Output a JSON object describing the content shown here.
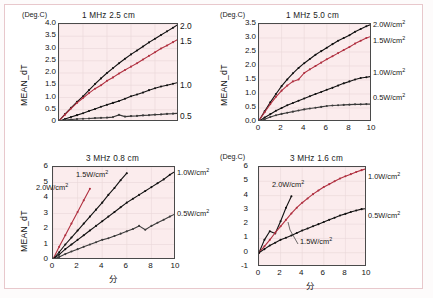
{
  "figure": {
    "y_axis_label": "MEAN_dT",
    "y_unit": "(Deg.C)",
    "x_axis_label": "分"
  },
  "chart_data": [
    {
      "type": "line",
      "id": "top-left",
      "title": "1 MHz 2.5 cm",
      "ylabel": "MEAN_dT",
      "yunit": "(Deg.C)",
      "xlabel": "分",
      "xlim": [
        0,
        10
      ],
      "ylim": [
        0,
        4.0
      ],
      "xticks": [
        "0",
        "2",
        "4",
        "6",
        "8",
        "10"
      ],
      "xticks_visible": false,
      "yticks": [
        "0",
        "0.5",
        "1.0",
        "1.5",
        "2.0",
        "2.5",
        "3.0",
        "3.5",
        "4.0"
      ],
      "right_labels": [
        "2.0",
        "1.5",
        "1.0",
        "0.5"
      ],
      "right_labels_unit": "W/cm2",
      "grid": true,
      "legend_position": "right",
      "series": [
        {
          "name": "2.0W/cm2",
          "color": "#111111",
          "x": [
            0,
            0.5,
            1,
            1.5,
            2,
            2.5,
            3,
            3.5,
            4,
            4.5,
            5,
            5.5,
            6,
            6.5,
            7,
            7.5,
            8,
            8.5,
            9,
            9.5,
            10
          ],
          "values": [
            0.05,
            0.32,
            0.58,
            0.82,
            1.05,
            1.3,
            1.55,
            1.78,
            2.0,
            2.2,
            2.4,
            2.58,
            2.76,
            2.92,
            3.08,
            3.25,
            3.4,
            3.55,
            3.7,
            3.85,
            4.0
          ]
        },
        {
          "name": "1.5W/cm2",
          "color": "#b03040",
          "x": [
            0,
            0.5,
            1,
            1.5,
            2,
            2.5,
            3,
            3.5,
            4,
            4.5,
            5,
            5.5,
            6,
            6.5,
            7,
            7.5,
            8,
            8.5,
            9,
            9.5,
            10
          ],
          "values": [
            0.05,
            0.3,
            0.55,
            0.78,
            0.98,
            1.18,
            1.36,
            1.5,
            1.68,
            1.82,
            1.98,
            2.12,
            2.26,
            2.4,
            2.55,
            2.7,
            2.85,
            3.0,
            3.12,
            3.26,
            3.4
          ]
        },
        {
          "name": "1.0W/cm2",
          "color": "#111111",
          "x": [
            0,
            0.5,
            1,
            1.5,
            2,
            2.5,
            3,
            3.5,
            4,
            4.5,
            5,
            5.5,
            6,
            6.5,
            7,
            7.5,
            8,
            8.5,
            9,
            9.5,
            10
          ],
          "values": [
            0.03,
            0.12,
            0.2,
            0.28,
            0.36,
            0.45,
            0.53,
            0.62,
            0.7,
            0.78,
            0.86,
            0.95,
            1.05,
            1.12,
            1.2,
            1.3,
            1.38,
            1.45,
            1.5,
            1.56,
            1.62
          ]
        },
        {
          "name": "0.5W/cm2",
          "color": "#3a3a3a",
          "x": [
            0,
            0.5,
            1,
            1.5,
            2,
            2.5,
            3,
            3.5,
            4,
            4.5,
            5,
            5.5,
            6,
            6.5,
            7,
            7.5,
            8,
            8.5,
            9,
            9.5,
            10
          ],
          "values": [
            0.02,
            0.08,
            0.1,
            0.12,
            0.13,
            0.14,
            0.16,
            0.17,
            0.18,
            0.2,
            0.29,
            0.22,
            0.24,
            0.25,
            0.27,
            0.28,
            0.3,
            0.31,
            0.33,
            0.34,
            0.36
          ]
        }
      ]
    },
    {
      "type": "line",
      "id": "top-right",
      "title": "1 MHz 5.0 cm",
      "ylabel": "MEAN_dT",
      "yunit": "(Deg.C)",
      "xlabel": "分",
      "xlim": [
        0,
        10
      ],
      "ylim": [
        0,
        3.5
      ],
      "xticks": [
        "0",
        "2",
        "4",
        "6",
        "8",
        "10"
      ],
      "xticks_visible": true,
      "yticks": [
        "0.0",
        "0.5",
        "1.0",
        "1.5",
        "2.0",
        "2.5",
        "3.0",
        "3.5"
      ],
      "grid": true,
      "legend_position": "right",
      "right_legend": [
        "2.0W/cm2",
        "1.5W/cm2",
        "1.0W/cm2",
        "0.5W/cm2"
      ],
      "series": [
        {
          "name": "2.0W/cm2",
          "color": "#111111",
          "x": [
            0,
            0.5,
            1,
            1.5,
            2,
            2.5,
            3,
            3.5,
            4,
            4.5,
            5,
            5.5,
            6,
            6.5,
            7,
            7.5,
            8,
            8.5,
            9,
            9.5,
            10
          ],
          "values": [
            0.05,
            0.38,
            0.7,
            1.0,
            1.28,
            1.52,
            1.74,
            1.93,
            2.1,
            2.25,
            2.4,
            2.53,
            2.65,
            2.78,
            2.9,
            3.0,
            3.1,
            3.22,
            3.32,
            3.42,
            3.5
          ]
        },
        {
          "name": "1.5W/cm2",
          "color": "#b03040",
          "x": [
            0,
            0.5,
            1,
            1.5,
            2,
            2.5,
            3,
            3.5,
            4,
            4.5,
            5,
            5.5,
            6,
            6.5,
            7,
            7.5,
            8,
            8.5,
            9,
            9.5,
            10
          ],
          "values": [
            0.05,
            0.35,
            0.64,
            0.9,
            1.12,
            1.3,
            1.45,
            1.52,
            1.75,
            1.88,
            2.0,
            2.12,
            2.24,
            2.35,
            2.46,
            2.57,
            2.68,
            2.8,
            2.9,
            3.0,
            3.07
          ]
        },
        {
          "name": "1.0W/cm2",
          "color": "#111111",
          "x": [
            0,
            0.5,
            1,
            1.5,
            2,
            2.5,
            3,
            3.5,
            4,
            4.5,
            5,
            5.5,
            6,
            6.5,
            7,
            7.5,
            8,
            8.5,
            9,
            9.5,
            10
          ],
          "values": [
            0.03,
            0.16,
            0.28,
            0.4,
            0.5,
            0.6,
            0.68,
            0.76,
            0.84,
            0.92,
            1.0,
            1.07,
            1.15,
            1.22,
            1.3,
            1.38,
            1.45,
            1.52,
            1.57,
            1.6,
            1.63
          ]
        },
        {
          "name": "0.5W/cm2",
          "color": "#3a3a3a",
          "x": [
            0,
            0.5,
            1,
            1.5,
            2,
            2.5,
            3,
            3.5,
            4,
            4.5,
            5,
            5.5,
            6,
            6.5,
            7,
            7.5,
            8,
            8.5,
            9,
            9.5,
            10
          ],
          "values": [
            0.02,
            0.1,
            0.18,
            0.24,
            0.29,
            0.33,
            0.37,
            0.41,
            0.45,
            0.48,
            0.51,
            0.54,
            0.57,
            0.59,
            0.6,
            0.61,
            0.62,
            0.63,
            0.63,
            0.64,
            0.64
          ]
        }
      ]
    },
    {
      "type": "line",
      "id": "bottom-left",
      "title": "3 MHz 0.8 cm",
      "ylabel": "MEAN_dT",
      "xlabel": "分",
      "xlim": [
        0,
        10
      ],
      "ylim": [
        0,
        6
      ],
      "xticks": [
        "0",
        "2",
        "4",
        "6",
        "8",
        "10"
      ],
      "xticks_visible": true,
      "yticks": [
        "0",
        "1",
        "2",
        "3",
        "4",
        "5",
        "6"
      ],
      "grid": true,
      "inline_labels": [
        "1.5W/cm2",
        "2.0W/cm2"
      ],
      "right_legend": [
        "1.0W/cm2",
        "0.5W/cm2"
      ],
      "series": [
        {
          "name": "2.0W/cm2",
          "color": "#b03040",
          "x": [
            0,
            0.5,
            1,
            1.5,
            2,
            2.5,
            3
          ],
          "values": [
            0.05,
            0.85,
            1.6,
            2.35,
            3.1,
            3.85,
            4.6
          ]
        },
        {
          "name": "1.5W/cm2",
          "color": "#111111",
          "x": [
            0,
            0.5,
            1,
            1.5,
            2,
            2.5,
            3,
            3.5,
            4,
            4.5,
            5,
            5.5,
            6
          ],
          "values": [
            0.05,
            0.5,
            1.0,
            1.45,
            1.9,
            2.35,
            2.8,
            3.25,
            3.7,
            4.2,
            4.65,
            5.15,
            5.6
          ]
        },
        {
          "name": "1.0W/cm2",
          "color": "#111111",
          "x": [
            0,
            0.5,
            1,
            1.5,
            2,
            2.5,
            3,
            3.5,
            4,
            4.5,
            5,
            5.5,
            6,
            6.5,
            7,
            7.5,
            8,
            8.5,
            9,
            9.5,
            10
          ],
          "values": [
            0.05,
            0.35,
            0.7,
            1.0,
            1.3,
            1.6,
            1.9,
            2.2,
            2.5,
            2.8,
            3.1,
            3.4,
            3.7,
            3.95,
            4.2,
            4.45,
            4.7,
            4.95,
            5.2,
            5.5,
            5.75
          ]
        },
        {
          "name": "0.5W/cm2",
          "color": "#3a3a3a",
          "x": [
            0,
            0.5,
            1,
            1.5,
            2,
            2.5,
            3,
            3.5,
            4,
            4.5,
            5,
            5.5,
            6,
            6.5,
            7,
            7.5,
            8,
            8.5,
            9,
            9.5,
            10
          ],
          "values": [
            0.03,
            0.2,
            0.38,
            0.55,
            0.7,
            0.85,
            1.0,
            1.15,
            1.3,
            1.4,
            1.55,
            1.7,
            1.85,
            2.0,
            2.2,
            1.95,
            2.2,
            2.4,
            2.6,
            2.8,
            3.0
          ]
        }
      ]
    },
    {
      "type": "line",
      "id": "bottom-right",
      "title": "3 MHz 1.6 cm",
      "ylabel": "MEAN_dT",
      "yunit": "(Deg.C)",
      "xlabel": "分",
      "xlim": [
        0,
        10
      ],
      "ylim": [
        -1,
        6
      ],
      "xticks": [
        "0",
        "2",
        "4",
        "6",
        "8",
        "10"
      ],
      "xticks_visible": true,
      "yticks": [
        "-1",
        "0",
        "1",
        "2",
        "3",
        "4",
        "5",
        "6"
      ],
      "grid": true,
      "inline_labels": [
        "2.0W/cm2",
        "1.5W/cm2"
      ],
      "right_legend": [
        "1.0W/cm2",
        "0.5W/cm2"
      ],
      "series": [
        {
          "name": "2.0W/cm2",
          "color": "#111111",
          "x": [
            0,
            0.5,
            1,
            1.5,
            2,
            2.5,
            3
          ],
          "values": [
            0.0,
            0.9,
            1.5,
            1.35,
            2.2,
            3.15,
            3.95
          ]
        },
        {
          "name": "1.0W/cm2",
          "color": "#b03040",
          "x": [
            0,
            0.5,
            1,
            1.5,
            2,
            2.5,
            3,
            3.5,
            4,
            4.5,
            5,
            5.5,
            6,
            6.5,
            7,
            7.5,
            8,
            8.5,
            9,
            9.5,
            10
          ],
          "values": [
            0.0,
            0.45,
            0.9,
            1.4,
            1.85,
            2.3,
            2.75,
            3.15,
            3.5,
            3.8,
            4.1,
            4.35,
            4.6,
            4.8,
            5.0,
            5.2,
            5.35,
            5.5,
            5.65,
            5.78,
            5.9
          ]
        },
        {
          "name": "0.5W/cm2",
          "color": "#111111",
          "x": [
            0,
            0.5,
            1,
            1.5,
            2,
            2.5,
            3,
            3.5,
            4,
            4.5,
            5,
            5.5,
            6,
            6.5,
            7,
            7.5,
            8,
            8.5,
            9,
            9.5,
            10
          ],
          "values": [
            0.0,
            0.25,
            0.5,
            0.7,
            0.9,
            1.05,
            1.2,
            1.38,
            1.55,
            1.7,
            1.85,
            2.0,
            2.15,
            2.3,
            2.45,
            2.6,
            2.72,
            2.85,
            2.95,
            3.05,
            3.1
          ]
        }
      ]
    }
  ]
}
